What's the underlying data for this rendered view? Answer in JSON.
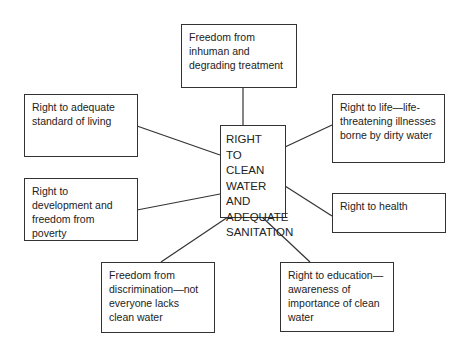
{
  "center": {
    "text": "RIGHT TO CLEAN WATER AND ADEQUATE SANITATION"
  },
  "nodes": [
    {
      "id": "top",
      "text": "Freedom from inhuman and degrading treatment"
    },
    {
      "id": "left-top",
      "text": "Right to adequate standard of living"
    },
    {
      "id": "right-top",
      "text": "Right to life—life-threatening illnesses borne by dirty water"
    },
    {
      "id": "left-middle",
      "text": "Right to development and freedom from poverty"
    },
    {
      "id": "right-middle",
      "text": "Right to health"
    },
    {
      "id": "bottom-left",
      "text": "Freedom from discrimination—not everyone lacks clean water"
    },
    {
      "id": "bottom-right",
      "text": "Right to education—awareness of importance of clean water"
    }
  ],
  "colors": {
    "line": "#333333",
    "text": "#222222",
    "background": "#ffffff"
  }
}
